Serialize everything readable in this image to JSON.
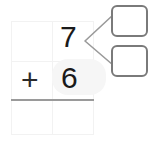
{
  "worksheet": {
    "title": "Two-digit addition place-value worksheet",
    "type": "arithmetic-decomposition",
    "operation_symbol": "+",
    "background_color": "#ffffff",
    "grid": {
      "columns": 2,
      "rows": 3,
      "column_labels": [
        "tens",
        "ones"
      ],
      "line_color": "#f2f2f2",
      "answer_rule_color": "#9a9a9a"
    },
    "cells": {
      "row1_tens": "",
      "row1_ones": "7",
      "row2_tens": "+",
      "row2_ones": "6",
      "row3_tens": "",
      "row3_ones": ""
    },
    "answer_boxes": [
      {
        "name": "decompose-box-top",
        "value": "",
        "border_color": "#7a7a7a"
      },
      {
        "name": "decompose-box-bottom",
        "value": "",
        "border_color": "#7a7a7a"
      }
    ],
    "connector": {
      "shape": "bracket-left-chevron",
      "color": "#9a9a9a",
      "points_from": "7",
      "points_to": [
        "decompose-box-top",
        "decompose-box-bottom"
      ]
    }
  }
}
